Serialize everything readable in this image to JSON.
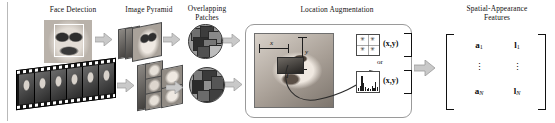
{
  "figure": {
    "width": 555,
    "height": 123,
    "background": "#ffffff",
    "rule_color": "#b9b9b9"
  },
  "stage_labels": {
    "face_detection": "Face  Detection",
    "image_pyramid": "Image Pyramid",
    "overlapping_patches": "Overlapping\nPatches",
    "location_augmentation": "Location Augmentation",
    "spatial_appearance_features": "Spatial-Appearance\nFeatures"
  },
  "location_panel": {
    "x_axis_label": "x",
    "y_axis_label": "y",
    "patch_label": "I",
    "descriptor_or": "or",
    "gabor_xy_label": "(x,y)",
    "histogram_xy_label": "(x,y)",
    "gabor_cells": [
      "✳",
      "✳",
      "✳",
      "✳"
    ]
  },
  "feature_matrix": {
    "rows": [
      {
        "appearance": "a",
        "appearance_sub": "1",
        "location": "l",
        "location_sub": "1"
      },
      {
        "appearance": "⋮",
        "appearance_sub": "",
        "location": "⋮",
        "location_sub": ""
      },
      {
        "appearance": "a",
        "appearance_sub": "N",
        "location": "l",
        "location_sub": "N"
      }
    ]
  },
  "icons": {
    "arrow": "block-arrow-right-icon",
    "curved_arrow": "curved-arrow-icon"
  },
  "colors": {
    "arrow_fill": "#c9c9c9",
    "arrow_stroke": "#8f8f8f",
    "panel_border": "#9a9a9a",
    "text": "#111111"
  }
}
